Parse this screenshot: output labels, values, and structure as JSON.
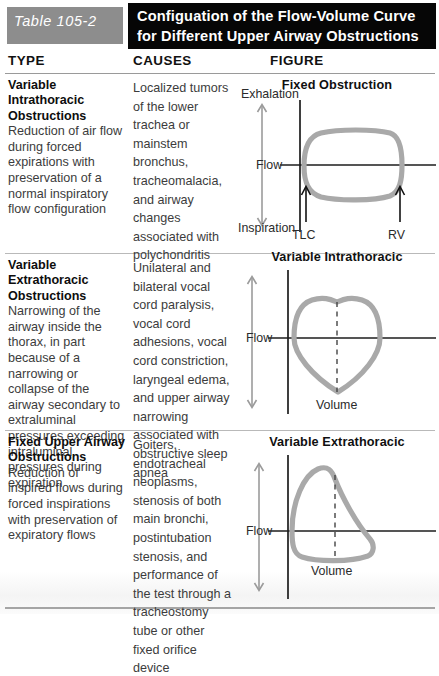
{
  "header": {
    "table_number": "Table 105-2",
    "title": "Configuation of the Flow-Volume Curve for Different Upper Airway Obstructions",
    "number_box_color": "#8d8d8d",
    "title_box_color": "#060606",
    "title_text_color": "#ffffff"
  },
  "columns": {
    "type": "TYPE",
    "causes": "CAUSES",
    "figure": "FIGURE"
  },
  "colors": {
    "curve_gray": "#a9a9a9",
    "axis_black": "#1d1d1d",
    "body_text": "#3c3c3c",
    "term_text": "#0d0d0d",
    "rule_gray": "#b9b9b9"
  },
  "rows": [
    {
      "type_term": "Variable Intrathoracic Obstructions",
      "type_desc": "Reduction of air flow during forced expirations with preservation of a normal inspiratory flow configuration",
      "causes": "Localized tumors of the lower trachea or mainstem bronchus, tracheomalacia, and airway changes associated with polychondritis",
      "figure": {
        "title": "Fixed Obstruction",
        "axis_top_label": "Exhalation",
        "axis_mid_label": "Flow",
        "axis_bottom_label": "Inspiration",
        "marker_left": "TLC",
        "marker_right": "RV",
        "volume_label": "",
        "shape": "rounded-box-loop",
        "has_dashed_midline": false
      }
    },
    {
      "type_term": "Variable Extrathoracic Obstructions",
      "type_desc": "Narrowing of the airway inside the thorax, in part because of a narrowing or collapse of the airway secondary to extraluminal pressures exceeding intraluminal pressures during expiration",
      "causes": "Unilateral and bilateral vocal cord paralysis, vocal cord adhesions, vocal cord constriction, laryngeal edema, and upper airway narrowing associated with obstructive sleep apnea",
      "figure": {
        "title": "Variable Intrathoracic",
        "axis_top_label": "",
        "axis_mid_label": "Flow",
        "axis_bottom_label": "",
        "marker_left": "",
        "marker_right": "",
        "volume_label": "Volume",
        "shape": "shield-loop-pointed-bottom",
        "has_dashed_midline": true
      }
    },
    {
      "type_term": "Fixed Upper Airway Obstructions",
      "type_desc": "Reduction of inspired flows during forced inspirations with preservation of expiratory flows",
      "causes": "Goiters, endotracheal neoplasms, stenosis of both main bronchi, postintubation stenosis, and performance of the test through a tracheostomy tube or other fixed orifice device",
      "figure": {
        "title": "Variable Extrathoracic",
        "axis_top_label": "",
        "axis_mid_label": "Flow",
        "axis_bottom_label": "",
        "marker_left": "",
        "marker_right": "",
        "volume_label": "Volume",
        "shape": "left-peak-loop-flat-bottom",
        "has_dashed_midline": true
      }
    }
  ]
}
